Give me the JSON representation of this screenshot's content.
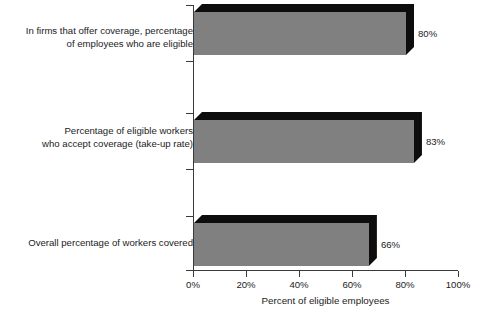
{
  "chart_data": {
    "type": "bar",
    "orientation": "horizontal",
    "title": "",
    "xlabel": "Percent of eligible employees",
    "ylabel": "",
    "xlim": [
      0,
      100
    ],
    "grid": false,
    "legend": null,
    "xticks": [
      "0%",
      "20%",
      "40%",
      "60%",
      "80%",
      "100%"
    ],
    "xtick_values": [
      0,
      20,
      40,
      60,
      80,
      100
    ],
    "categories": [
      "In firms that offer coverage, percentage\nof employees who are eligible",
      "Percentage of eligible workers\nwho accept coverage (take-up rate)",
      "Overall percentage of workers covered"
    ],
    "values": [
      80,
      83,
      66
    ],
    "value_labels": [
      "80%",
      "83%",
      "66%"
    ],
    "colors": {
      "bar_face": "#808080",
      "bar_shadow": "#0d0d0d",
      "axis": "#3a3a3a",
      "text": "#1c1c1c",
      "background": "#ffffff"
    }
  }
}
